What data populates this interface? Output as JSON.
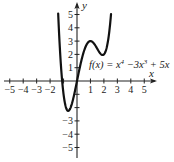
{
  "chart_data": {
    "type": "line",
    "title": "",
    "function_label": "f(x) = x⁴ −3x³ + 5x",
    "function_label_parts": {
      "lhs": "f(x) = x",
      "exp1": "4",
      "mid": " −3x",
      "exp2": "3",
      "rhs": " + 5x"
    },
    "xlabel": "x",
    "ylabel": "y",
    "xlim": [
      -5,
      5
    ],
    "ylim": [
      -5,
      5
    ],
    "grid": false,
    "x_ticks": [
      -5,
      -4,
      -3,
      -2,
      -1,
      1,
      2,
      3,
      4,
      5
    ],
    "x_tick_labels": [
      "−5",
      "−4",
      "−3",
      "−2",
      "1",
      "2",
      "3",
      "4",
      "5"
    ],
    "y_ticks": [
      -5,
      -4,
      -3,
      -2,
      -1,
      1,
      2,
      3,
      4,
      5
    ],
    "y_tick_labels": [
      "5",
      "4",
      "3",
      "2",
      "1",
      "−3",
      "−4",
      "−5"
    ],
    "series": [
      {
        "name": "f(x) = x^4 - 3x^3 + 5x",
        "x": [
          -1.4,
          -1.3,
          -1.2,
          -1.1,
          -1.0,
          -0.8,
          -0.6,
          -0.5,
          -0.4,
          -0.2,
          0.0,
          0.2,
          0.4,
          0.6,
          0.8,
          1.0,
          1.2,
          1.4,
          1.6,
          1.8,
          2.0,
          2.2,
          2.4,
          2.5,
          2.53
        ],
        "y": [
          5.07,
          2.95,
          1.26,
          -0.04,
          -1.0,
          -2.05,
          -2.22,
          -2.06,
          -1.78,
          -0.97,
          0.0,
          0.98,
          1.83,
          2.48,
          2.87,
          3.0,
          2.89,
          2.61,
          2.26,
          2.0,
          2.0,
          2.5,
          3.7,
          4.69,
          5.05
        ]
      }
    ],
    "annotations": [
      {
        "text": "f(x) = x^4 −3x^3 + 5x",
        "position": "right of curve, above x-axis"
      }
    ],
    "legend": null
  }
}
